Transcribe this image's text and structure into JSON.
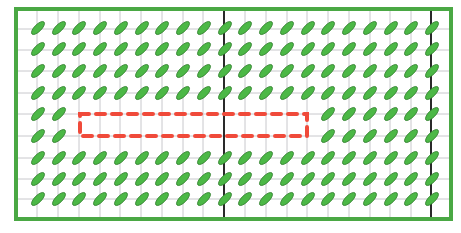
{
  "diagram": {
    "type": "planting-grid",
    "colors": {
      "background": "#ffffff",
      "border": "#4aa844",
      "grid_line": "#c8c8cc",
      "divider_line": "#2a2a2a",
      "leaf_fill": "#4cb846",
      "leaf_stroke": "#2f7d2c",
      "selection": "#f04a3a"
    },
    "border": {
      "x": 16,
      "y": 9,
      "width": 435,
      "height": 210
    },
    "grid": {
      "columns_x": [
        16,
        37,
        58,
        79,
        100,
        120,
        141,
        162,
        183,
        203,
        224,
        245,
        266,
        287,
        307,
        328,
        349,
        370,
        390,
        411,
        431,
        451
      ],
      "rows_y": [
        9,
        29,
        50,
        71,
        93,
        114,
        136,
        158,
        179,
        199,
        219
      ],
      "dark_dividers_x": [
        224,
        431
      ]
    },
    "leaves": {
      "columns_x": [
        38,
        59,
        79,
        100,
        121,
        142,
        162,
        183,
        204,
        225,
        245,
        266,
        287,
        308,
        328,
        349,
        370,
        391,
        411,
        432
      ],
      "rows_y": [
        28,
        49,
        71,
        93,
        114,
        136,
        158,
        179,
        199
      ],
      "length": 17,
      "width": 7,
      "angle": -45,
      "missing": [
        {
          "row": 4,
          "col_from": 2,
          "col_to": 13
        },
        {
          "row": 5,
          "col_from": 2,
          "col_to": 13
        }
      ]
    },
    "selection_box": {
      "x": 80,
      "y": 114,
      "width": 227,
      "height": 22,
      "dash": "9,7",
      "label": "empty-region"
    }
  }
}
